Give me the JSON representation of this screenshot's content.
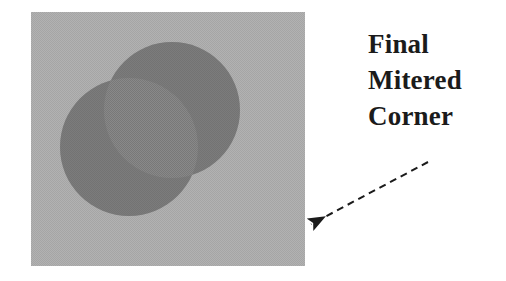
{
  "figure": {
    "title_lines": [
      "Final",
      "Mitered",
      "Corner"
    ],
    "annotation_text": "Final Mitered Corner",
    "background_color": "#ffffff",
    "panel": {
      "name": "gray-square-panel",
      "fill_color": "#a9a9a9",
      "x": 31,
      "y": 12,
      "width": 274,
      "height": 254
    },
    "shapes": [
      {
        "name": "upper-right-circle",
        "type": "circle",
        "fill_color": "#6d6d6d",
        "cx": 172,
        "cy": 110,
        "r": 68
      },
      {
        "name": "lower-left-circle",
        "type": "circle",
        "fill_color": "#6d6d6d",
        "cx": 129,
        "cy": 147,
        "r": 69
      }
    ],
    "arrow": {
      "name": "dashed-pointer-arrow",
      "color": "#1b1b1b",
      "start_x": 428,
      "start_y": 162,
      "end_x": 304,
      "end_y": 228,
      "dash_pattern": "7 5",
      "stroke_width": 2,
      "points_at": "mitered-corner"
    },
    "text_color": "#1b1b1b"
  }
}
